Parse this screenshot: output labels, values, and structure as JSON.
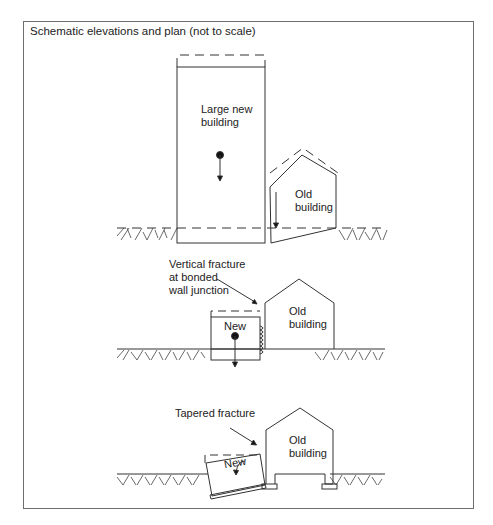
{
  "figure": {
    "title": "Schematic elevations and plan (not to scale)",
    "colors": {
      "stroke": "#333333",
      "frame": "#6e6e6e",
      "background": "#ffffff"
    }
  },
  "panels": [
    {
      "id": "top",
      "labels": {
        "new_building_line1": "Large new",
        "new_building_line2": "building",
        "old_building_line1": "Old",
        "old_building_line2": "building"
      }
    },
    {
      "id": "middle",
      "labels": {
        "annotation_line1": "Vertical fracture",
        "annotation_line2": "at bonded",
        "annotation_line3": "wall junction",
        "new_building": "New",
        "old_building_line1": "Old",
        "old_building_line2": "building"
      }
    },
    {
      "id": "bottom",
      "labels": {
        "annotation": "Tapered fracture",
        "new_building": "New",
        "old_building_line1": "Old",
        "old_building_line2": "building"
      }
    }
  ]
}
